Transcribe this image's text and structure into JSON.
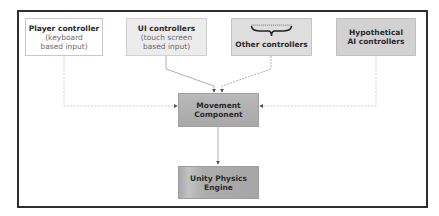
{
  "diagram": {
    "type": "flowchart",
    "nodes": [
      {
        "id": "player",
        "title": "Player controller",
        "subtitle_line1": "(keyboard",
        "subtitle_line2": "based input)"
      },
      {
        "id": "ui",
        "title": "UI controllers",
        "subtitle_line1": "(touch screen",
        "subtitle_line2": "based input)"
      },
      {
        "id": "other",
        "title": "Other controllers",
        "icon": "brace-icon"
      },
      {
        "id": "ai",
        "title_line1": "Hypothetical",
        "title_line2": "AI controllers"
      },
      {
        "id": "movement",
        "title_line1": "Movement",
        "title_line2": "Component"
      },
      {
        "id": "physics",
        "title": "Unity Physics Engine"
      }
    ],
    "edges": [
      {
        "from": "player",
        "to": "movement"
      },
      {
        "from": "ui",
        "to": "movement"
      },
      {
        "from": "other",
        "to": "movement"
      },
      {
        "from": "ai",
        "to": "movement"
      },
      {
        "from": "movement",
        "to": "physics"
      }
    ],
    "colors": {
      "frame": "#2e2e2e",
      "connector": "#b8b8b8",
      "arrowhead": "#555555",
      "player_fill": "#ffffff",
      "ui_fill": "#ececec",
      "other_fill": "#dedede",
      "ai_fill": "#d2d2d2",
      "movement_fill": "#b0b0b0",
      "physics_fill": "#aaaaaa"
    }
  }
}
